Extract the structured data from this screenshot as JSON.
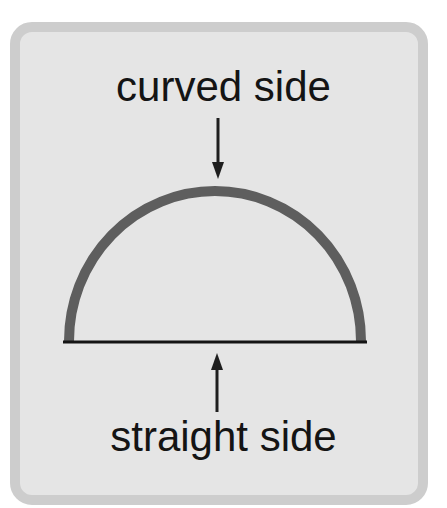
{
  "diagram": {
    "labels": {
      "curved_side": "curved side",
      "straight_side": "straight side"
    },
    "shape": {
      "type": "semicircle",
      "parts": [
        {
          "name": "curved side",
          "style": "thick gray arc"
        },
        {
          "name": "straight side",
          "style": "thin black line"
        }
      ]
    },
    "arrows": [
      {
        "from": "curved side label",
        "to": "curved side",
        "direction": "down"
      },
      {
        "from": "straight side label",
        "to": "straight side",
        "direction": "up"
      }
    ],
    "colors": {
      "card_background": "#e5e5e5",
      "card_border": "#cdcdcd",
      "arc_stroke": "#5e5e5e",
      "baseline_stroke": "#141414",
      "text": "#141414",
      "arrow": "#1e1e1e"
    }
  }
}
